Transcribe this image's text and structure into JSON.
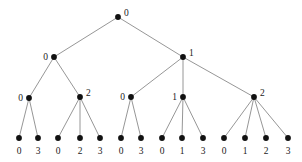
{
  "figure": {
    "kind": "tree-diagram",
    "width": 302,
    "height": 162,
    "background_color": "#ffffff",
    "edge_color": "#8a8a8a",
    "node_color": "#111111",
    "label_color": "#1a1a1a"
  },
  "chart_data": {
    "type": "tree",
    "title": "",
    "levels": 4,
    "node_count": 20,
    "leaf_count": 14,
    "nodes": [
      {
        "id": "root",
        "label": "0",
        "x": 118,
        "y": 17,
        "level": 0,
        "label_side": "right"
      },
      {
        "id": "n-0",
        "label": "0",
        "x": 54,
        "y": 57,
        "level": 1,
        "label_side": "left"
      },
      {
        "id": "n-1",
        "label": "1",
        "x": 183,
        "y": 57,
        "level": 1,
        "label_side": "right"
      },
      {
        "id": "n-0-0",
        "label": "0",
        "x": 29,
        "y": 98,
        "level": 2,
        "label_side": "left"
      },
      {
        "id": "n-0-2",
        "label": "2",
        "x": 80,
        "y": 97,
        "level": 2,
        "label_side": "right"
      },
      {
        "id": "n-1-0",
        "label": "0",
        "x": 131,
        "y": 97,
        "level": 2,
        "label_side": "left"
      },
      {
        "id": "n-1-1",
        "label": "1",
        "x": 183,
        "y": 97,
        "level": 2,
        "label_side": "left"
      },
      {
        "id": "n-1-2",
        "label": "2",
        "x": 254,
        "y": 97,
        "level": 2,
        "label_side": "right"
      },
      {
        "id": "l-1",
        "label": "0",
        "x": 19,
        "y": 138,
        "level": 3,
        "label_side": "below"
      },
      {
        "id": "l-2",
        "label": "3",
        "x": 38,
        "y": 138,
        "level": 3,
        "label_side": "below"
      },
      {
        "id": "l-3",
        "label": "0",
        "x": 58,
        "y": 138,
        "level": 3,
        "label_side": "below"
      },
      {
        "id": "l-4",
        "label": "2",
        "x": 80,
        "y": 138,
        "level": 3,
        "label_side": "below"
      },
      {
        "id": "l-5",
        "label": "3",
        "x": 100,
        "y": 138,
        "level": 3,
        "label_side": "below"
      },
      {
        "id": "l-6",
        "label": "0",
        "x": 121,
        "y": 138,
        "level": 3,
        "label_side": "below"
      },
      {
        "id": "l-7",
        "label": "3",
        "x": 141,
        "y": 138,
        "level": 3,
        "label_side": "below"
      },
      {
        "id": "l-8",
        "label": "0",
        "x": 162,
        "y": 138,
        "level": 3,
        "label_side": "below"
      },
      {
        "id": "l-9",
        "label": "1",
        "x": 182,
        "y": 138,
        "level": 3,
        "label_side": "below"
      },
      {
        "id": "l-10",
        "label": "3",
        "x": 203,
        "y": 138,
        "level": 3,
        "label_side": "below"
      },
      {
        "id": "l-11",
        "label": "0",
        "x": 224,
        "y": 138,
        "level": 3,
        "label_side": "below"
      },
      {
        "id": "l-12",
        "label": "1",
        "x": 245,
        "y": 138,
        "level": 3,
        "label_side": "below"
      },
      {
        "id": "l-13",
        "label": "2",
        "x": 266,
        "y": 138,
        "level": 3,
        "label_side": "below"
      },
      {
        "id": "l-14",
        "label": "3",
        "x": 288,
        "y": 138,
        "level": 3,
        "label_side": "below"
      }
    ],
    "edges": [
      {
        "from": "root",
        "to": "n-0"
      },
      {
        "from": "root",
        "to": "n-1"
      },
      {
        "from": "n-0",
        "to": "n-0-0"
      },
      {
        "from": "n-0",
        "to": "n-0-2"
      },
      {
        "from": "n-1",
        "to": "n-1-0"
      },
      {
        "from": "n-1",
        "to": "n-1-1"
      },
      {
        "from": "n-1",
        "to": "n-1-2"
      },
      {
        "from": "n-0-0",
        "to": "l-1"
      },
      {
        "from": "n-0-0",
        "to": "l-2"
      },
      {
        "from": "n-0-2",
        "to": "l-3"
      },
      {
        "from": "n-0-2",
        "to": "l-4"
      },
      {
        "from": "n-0-2",
        "to": "l-5"
      },
      {
        "from": "n-1-0",
        "to": "l-6"
      },
      {
        "from": "n-1-0",
        "to": "l-7"
      },
      {
        "from": "n-1-1",
        "to": "l-8"
      },
      {
        "from": "n-1-1",
        "to": "l-9"
      },
      {
        "from": "n-1-1",
        "to": "l-10"
      },
      {
        "from": "n-1-2",
        "to": "l-11"
      },
      {
        "from": "n-1-2",
        "to": "l-12"
      },
      {
        "from": "n-1-2",
        "to": "l-13"
      },
      {
        "from": "n-1-2",
        "to": "l-14"
      }
    ],
    "leaf_labels": [
      "0",
      "3",
      "0",
      "2",
      "3",
      "0",
      "3",
      "0",
      "1",
      "3",
      "0",
      "1",
      "2",
      "3"
    ],
    "root_label": "0",
    "level1_labels": [
      "0",
      "1"
    ],
    "level2_labels": [
      "0",
      "2",
      "0",
      "1",
      "2"
    ]
  }
}
